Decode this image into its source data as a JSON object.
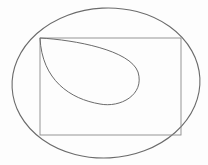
{
  "diagram": {
    "stroke_color": "#6b6b6b",
    "background": "#fdfdfd",
    "shapes": [
      {
        "type": "ellipse",
        "name": "outer-ellipse",
        "cx": 106,
        "cy": 84,
        "rx": 94,
        "ry": 75
      },
      {
        "type": "rectangle",
        "name": "inscribed-rectangle",
        "x": 40,
        "y": 38,
        "width": 141,
        "height": 97
      },
      {
        "type": "teardrop",
        "name": "teardrop-curve",
        "apex": [
          40,
          38
        ],
        "extent_right": 138,
        "extent_bottom": 105
      }
    ]
  }
}
